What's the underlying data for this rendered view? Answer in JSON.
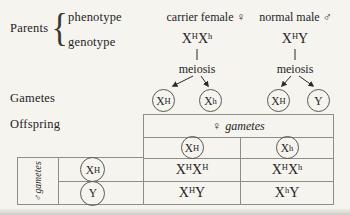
{
  "colors": {
    "background": "#f5f4ef",
    "text": "#26231f",
    "table_line": "#8f8d88",
    "circle_line": "#5c5953"
  },
  "labels": {
    "parents": "Parents",
    "phenotype": "phenotype",
    "genotype": "genotype",
    "gametes": "Gametes",
    "offspring": "Offspring"
  },
  "female": {
    "phenotype": "carrier female",
    "symbol": "♀",
    "genotype": {
      "b1": "X",
      "s1": "H",
      "b2": "X",
      "s2": "h"
    },
    "meiosis": "meiosis",
    "gametes": [
      {
        "b": "X",
        "s": "H"
      },
      {
        "b": "X",
        "s": "h"
      }
    ]
  },
  "male": {
    "phenotype": "normal male",
    "symbol": "♂",
    "genotype": {
      "b1": "X",
      "s1": "H",
      "b2": "Y",
      "s2": ""
    },
    "meiosis": "meiosis",
    "gametes": [
      {
        "b": "X",
        "s": "H"
      },
      {
        "b": "Y",
        "s": ""
      }
    ]
  },
  "punnett": {
    "female_gametes_header": {
      "symbol": "♀",
      "label": "gametes"
    },
    "male_gametes_header": {
      "symbol": "♂",
      "label": "gametes"
    },
    "female_gametes": [
      {
        "b": "X",
        "s": "H"
      },
      {
        "b": "X",
        "s": "h"
      }
    ],
    "male_gametes": [
      {
        "b": "X",
        "s": "H"
      },
      {
        "b": "Y",
        "s": ""
      }
    ],
    "offspring": [
      [
        {
          "b1": "X",
          "s1": "H",
          "b2": "X",
          "s2": "H"
        },
        {
          "b1": "X",
          "s1": "H",
          "b2": "X",
          "s2": "h"
        }
      ],
      [
        {
          "b1": "X",
          "s1": "H",
          "b2": "Y",
          "s2": ""
        },
        {
          "b1": "X",
          "s1": "h",
          "b2": "Y",
          "s2": ""
        }
      ]
    ]
  }
}
